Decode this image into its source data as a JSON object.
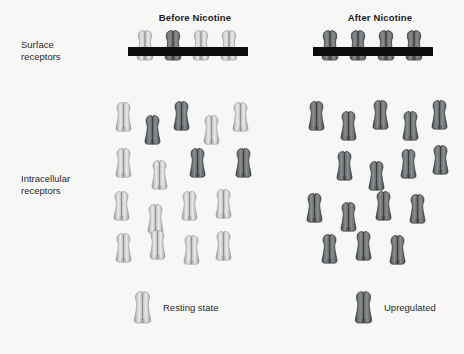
{
  "figure": {
    "background_color": "#f7f7f6",
    "membrane_color": "#0c0c0c",
    "width": 464,
    "height": 354
  },
  "columns": [
    {
      "id": "before",
      "title": "Before Nicotine"
    },
    {
      "id": "after",
      "title": "After Nicotine"
    }
  ],
  "row_labels": {
    "surface_line1": "Surface",
    "surface_line2": "receptors",
    "intracellular_line1": "Intracellular",
    "intracellular_line2": "receptors"
  },
  "legend": {
    "resting": {
      "label": "Resting state",
      "state": "resting",
      "color_light": "#e8e9ea",
      "color_mid": "#c6c8ca",
      "color_dark": "#8f9295"
    },
    "upregulated": {
      "label": "Upregulated",
      "state": "upregulated",
      "color_light": "#8b8e91",
      "color_mid": "#6c6f72",
      "color_dark": "#3d4043"
    }
  },
  "caption": "",
  "receptor_states": {
    "resting": "light-grey receptor, resting state",
    "upregulated": "dark-grey receptor, upregulated state"
  },
  "panels": {
    "before": {
      "surface_receptor_count": 4,
      "surface_receptors": [
        {
          "x": 133,
          "y": 29,
          "state": "resting"
        },
        {
          "x": 161,
          "y": 29,
          "state": "upregulated"
        },
        {
          "x": 189,
          "y": 29,
          "state": "resting"
        },
        {
          "x": 217,
          "y": 29,
          "state": "resting"
        }
      ],
      "intracellular_receptor_count": 17,
      "intracellular_receptors": [
        {
          "x": 112,
          "y": 101,
          "state": "resting"
        },
        {
          "x": 141,
          "y": 114,
          "state": "upregulated"
        },
        {
          "x": 170,
          "y": 100,
          "state": "upregulated"
        },
        {
          "x": 200,
          "y": 114,
          "state": "resting"
        },
        {
          "x": 229,
          "y": 101,
          "state": "resting"
        },
        {
          "x": 112,
          "y": 147,
          "state": "resting"
        },
        {
          "x": 148,
          "y": 159,
          "state": "resting"
        },
        {
          "x": 186,
          "y": 147,
          "state": "upregulated"
        },
        {
          "x": 232,
          "y": 147,
          "state": "upregulated"
        },
        {
          "x": 110,
          "y": 190,
          "state": "resting"
        },
        {
          "x": 144,
          "y": 203,
          "state": "resting"
        },
        {
          "x": 178,
          "y": 190,
          "state": "resting"
        },
        {
          "x": 212,
          "y": 188,
          "state": "resting"
        },
        {
          "x": 112,
          "y": 232,
          "state": "resting"
        },
        {
          "x": 146,
          "y": 229,
          "state": "resting"
        },
        {
          "x": 180,
          "y": 234,
          "state": "resting"
        },
        {
          "x": 212,
          "y": 230,
          "state": "resting"
        }
      ]
    },
    "after": {
      "surface_receptor_count": 4,
      "surface_receptors": [
        {
          "x": 318,
          "y": 29,
          "state": "upregulated"
        },
        {
          "x": 346,
          "y": 29,
          "state": "upregulated"
        },
        {
          "x": 374,
          "y": 29,
          "state": "upregulated"
        },
        {
          "x": 402,
          "y": 29,
          "state": "upregulated"
        }
      ],
      "intracellular_receptor_count": 16,
      "intracellular_receptors": [
        {
          "x": 305,
          "y": 100,
          "state": "upregulated"
        },
        {
          "x": 337,
          "y": 110,
          "state": "upregulated"
        },
        {
          "x": 369,
          "y": 99,
          "state": "upregulated"
        },
        {
          "x": 399,
          "y": 110,
          "state": "upregulated"
        },
        {
          "x": 428,
          "y": 99,
          "state": "upregulated"
        },
        {
          "x": 333,
          "y": 150,
          "state": "upregulated"
        },
        {
          "x": 365,
          "y": 160,
          "state": "upregulated"
        },
        {
          "x": 397,
          "y": 148,
          "state": "upregulated"
        },
        {
          "x": 429,
          "y": 144,
          "state": "upregulated"
        },
        {
          "x": 303,
          "y": 192,
          "state": "upregulated"
        },
        {
          "x": 337,
          "y": 201,
          "state": "upregulated"
        },
        {
          "x": 372,
          "y": 190,
          "state": "upregulated"
        },
        {
          "x": 406,
          "y": 193,
          "state": "upregulated"
        },
        {
          "x": 318,
          "y": 233,
          "state": "upregulated"
        },
        {
          "x": 352,
          "y": 230,
          "state": "upregulated"
        },
        {
          "x": 386,
          "y": 234,
          "state": "upregulated"
        }
      ]
    }
  },
  "legend_items_geometry": {
    "resting_receptor": {
      "x": 130,
      "y": 290
    },
    "upregulated_receptor": {
      "x": 351,
      "y": 290
    }
  }
}
